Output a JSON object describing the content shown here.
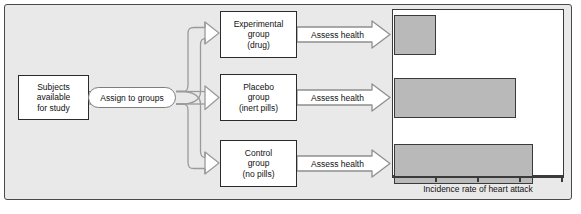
{
  "diagram": {
    "background_color": "#e9e9e9",
    "border_color": "#4a4a4a"
  },
  "source_node": {
    "name": "subjects-box",
    "lines": [
      "Subjects",
      "available",
      "for study"
    ]
  },
  "assignment": {
    "label": "Assign to groups"
  },
  "groups": [
    {
      "id": "experimental",
      "lines": [
        "Experimental",
        "group",
        "(drug)"
      ]
    },
    {
      "id": "placebo",
      "lines": [
        "Placebo",
        "group",
        "(inert pills)"
      ]
    },
    {
      "id": "control",
      "lines": [
        "Control",
        "group",
        "(no pills)"
      ]
    }
  ],
  "assess_arrows": [
    {
      "label": "Assess health"
    },
    {
      "label": "Assess health"
    },
    {
      "label": "Assess health"
    }
  ],
  "chart_data": {
    "type": "bar",
    "orientation": "horizontal",
    "title": "",
    "xlabel": "Incidence rate of heart attack",
    "ylabel": "",
    "categories": [
      "Experimental group (drug)",
      "Placebo group (inert pills)",
      "Control group (no pills)"
    ],
    "values": [
      1.0,
      2.9,
      3.3
    ],
    "xlim": [
      0,
      4
    ],
    "tick_values": [
      1,
      2,
      3,
      4
    ],
    "grid": false,
    "legend": "none",
    "bar_color": "#b9b9b9",
    "bar_border_color": "#3a3a3a",
    "plot_background": "#ffffff"
  },
  "chart_axis": {
    "label": "Incidence rate of heart attack",
    "tick_count": 4
  }
}
